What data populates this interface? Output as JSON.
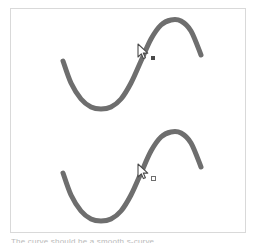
{
  "figure": {
    "title": "",
    "background_color": "#ffffff",
    "border_color": "#d9d9d9",
    "curve_color": "#6e6e6e",
    "curve_width": 5
  },
  "caption": {
    "text": "The curve should be a smooth s-curve"
  },
  "cursors": [
    {
      "name": "pointer-top",
      "x": 137,
      "y": 43,
      "mark": "filled-dot",
      "mark_color": "#4a4a4a"
    },
    {
      "name": "pointer-bottom",
      "x": 137,
      "y": 163,
      "mark": "hollow-square",
      "mark_color": "#6e6e6e"
    }
  ],
  "chart_data": [
    {
      "type": "line",
      "name": "s-curve-top",
      "title": "",
      "xlabel": "",
      "ylabel": "",
      "grid": false,
      "legend": "none",
      "xlim": [
        0,
        236
      ],
      "ylim": [
        0,
        112
      ],
      "series": [
        {
          "name": "s-curve",
          "x": [
            52,
            60,
            70,
            80,
            90,
            100,
            110,
            120,
            130,
            140,
            150,
            160,
            170,
            180,
            190
          ],
          "y": [
            52,
            74,
            90,
            98,
            100,
            98,
            90,
            74,
            52,
            30,
            16,
            11,
            12,
            22,
            46
          ]
        }
      ]
    },
    {
      "type": "line",
      "name": "s-curve-bottom",
      "title": "",
      "xlabel": "",
      "ylabel": "",
      "grid": false,
      "legend": "none",
      "xlim": [
        0,
        236
      ],
      "ylim": [
        0,
        112
      ],
      "series": [
        {
          "name": "s-curve",
          "x": [
            52,
            60,
            70,
            80,
            90,
            100,
            110,
            120,
            130,
            140,
            150,
            160,
            170,
            180,
            190
          ],
          "y": [
            52,
            74,
            90,
            98,
            100,
            98,
            90,
            74,
            52,
            30,
            16,
            11,
            12,
            22,
            46
          ]
        }
      ]
    }
  ]
}
